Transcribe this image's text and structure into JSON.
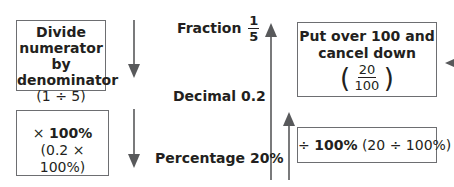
{
  "diagram": {
    "labels": {
      "fraction": {
        "text": "Fraction",
        "numerator": "1",
        "denominator": "5"
      },
      "decimal": {
        "text": "Decimal 0.2"
      },
      "percentage": {
        "text": "Percentage 20%"
      }
    },
    "boxes": {
      "fraction_to_decimal": {
        "title_line1": "Divide",
        "title_line2": "numerator by",
        "title_line3": "denominator",
        "example": "(1 ÷ 5)"
      },
      "decimal_to_percentage": {
        "op_symbol": "×",
        "op_value": "100%",
        "example": "(0.2 × 100%)"
      },
      "percentage_to_fraction": {
        "title_line1": "Put over 100 and",
        "title_line2": "cancel down",
        "numerator": "20",
        "denominator": "100",
        "open_paren": "(",
        "close_paren": ")"
      },
      "percentage_to_decimal": {
        "op_symbol": "÷",
        "op_value": "100%",
        "example": "(20 ÷ 100%)"
      }
    },
    "colors": {
      "arrow": "#58595b",
      "border": "#6d6e71",
      "text": "#231f20"
    }
  }
}
